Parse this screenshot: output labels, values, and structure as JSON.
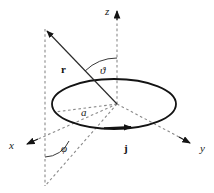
{
  "figure": {
    "background_color": "#ffffff",
    "line_color": "#1a1a1a",
    "dashed_color": "#7a7a7a",
    "width": 214,
    "height": 193
  },
  "axes": [
    {
      "name": "z",
      "label": "z",
      "label_x": 105,
      "label_y": 14,
      "from_x": 117,
      "from_y": 104,
      "to_x": 117,
      "to_y": 16,
      "arrow_x": 117,
      "arrow_y": 10,
      "style": "dashed"
    },
    {
      "name": "x",
      "label": "x",
      "label_x": 9,
      "label_y": 148,
      "from_x": 117,
      "from_y": 104,
      "to_x": 34,
      "to_y": 141,
      "arrow_x": 25,
      "arrow_y": 145,
      "style": "dashed"
    },
    {
      "name": "y",
      "label": "y",
      "label_x": 201,
      "label_y": 151,
      "from_x": 117,
      "from_y": 104,
      "to_x": 183,
      "to_y": 139,
      "arrow_x": 192,
      "arrow_y": 144,
      "style": "dashed"
    }
  ],
  "loop": {
    "name": "current-loop",
    "center_x": 114,
    "center_y": 104,
    "radius_x": 62,
    "radius_y": 25,
    "stroke_width": 1.8
  },
  "current": {
    "symbol": "j",
    "label": "j",
    "label_x": 125,
    "label_y": 151,
    "arrow_x": 131,
    "arrow_y": 127,
    "description": "surface current density direction along the loop"
  },
  "position_vector": {
    "symbol": "r",
    "label": "r",
    "label_x": 64,
    "label_y": 71,
    "from_x": 117,
    "from_y": 104,
    "to_x": 48,
    "to_y": 32,
    "arrow_x": 44,
    "arrow_y": 28,
    "stroke_width": 1.0
  },
  "angles": [
    {
      "name": "theta",
      "symbol": "ϑ",
      "label": "ϑ",
      "label_x": 103,
      "label_y": 72,
      "between": [
        "z-axis",
        "position-vector"
      ],
      "arc_radius": 46
    },
    {
      "name": "phi",
      "symbol": "φ",
      "label": "φ",
      "label_x": 64,
      "label_y": 151,
      "between": [
        "x-projection",
        "vertical-drop-line"
      ],
      "arc_radius": 27
    }
  ],
  "radius": {
    "symbol": "a",
    "label": "a",
    "label_x": 84,
    "label_y": 114,
    "from_x": 117,
    "from_y": 104,
    "to_x": 56,
    "to_y": 110,
    "description": "loop radius"
  },
  "projection_lines": [
    {
      "name": "vertical-drop-line",
      "from_x": 45,
      "from_y": 28,
      "to_x": 45,
      "to_y": 185
    },
    {
      "name": "origin-to-foot-line",
      "from_x": 117,
      "from_y": 104,
      "to_x": 45,
      "to_y": 185
    }
  ]
}
